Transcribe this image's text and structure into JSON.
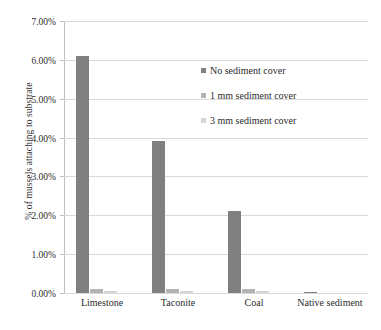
{
  "chart_data": {
    "type": "bar",
    "title": "",
    "subtitle": "",
    "xlabel": "",
    "ylabel": "% of mussels attaching to substrate",
    "categories": [
      "Limestone",
      "Taconite",
      "Coal",
      "Native sediment"
    ],
    "series": [
      {
        "name": "No sediment cover",
        "color": "#808080",
        "values": [
          6.1,
          3.9,
          2.1,
          0.03
        ]
      },
      {
        "name": "1 mm sediment cover",
        "color": "#b3b3b3",
        "values": [
          0.1,
          0.1,
          0.1,
          0.0
        ]
      },
      {
        "name": "3 mm sediment cover",
        "color": "#d6d6d6",
        "values": [
          0.05,
          0.05,
          0.05,
          0.0
        ]
      }
    ],
    "ylim": [
      0,
      7
    ],
    "ytick_values": [
      0,
      1,
      2,
      3,
      4,
      5,
      6,
      7
    ],
    "ytick_labels": [
      "0.00%",
      "1.00%",
      "2.00%",
      "3.00%",
      "4.00%",
      "5.00%",
      "6.00%",
      "7.00%"
    ],
    "grid": true,
    "grid_axis": "y",
    "legend_position": "inside-upper-right",
    "background_color": "#ffffff",
    "grid_color": "#d9d9d9",
    "text_color": "#2b2b2b"
  },
  "legend": {
    "items": [
      {
        "label": "No sediment cover"
      },
      {
        "label": "1 mm sediment cover"
      },
      {
        "label": "3 mm sediment cover"
      }
    ]
  }
}
